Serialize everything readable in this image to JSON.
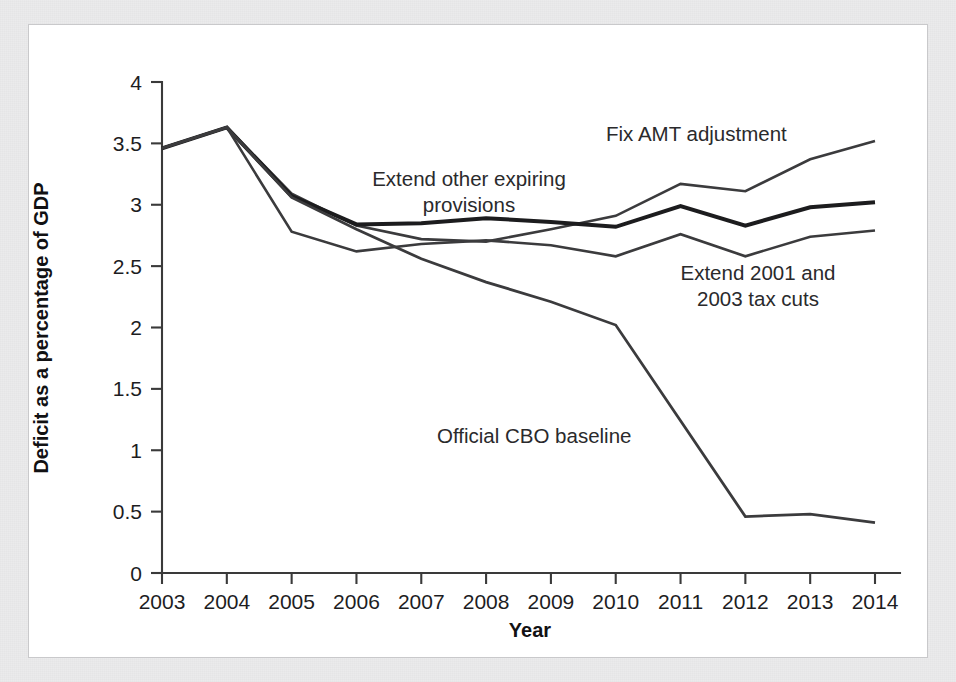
{
  "figure": {
    "frame_color": "#ebebec",
    "plate_color": "#ffffff",
    "plate_border_color": "#c9c9cb",
    "ink_color": "#2b2b2d"
  },
  "axis": {
    "x_title": "Year",
    "y_title": "Deficit as a percentage of GDP",
    "y_ticks": [
      "0",
      "0.5",
      "1",
      "1.5",
      "2",
      "2.5",
      "3",
      "3.5",
      "4"
    ],
    "x_ticks": [
      "2003",
      "2004",
      "2005",
      "2006",
      "2007",
      "2008",
      "2009",
      "2010",
      "2011",
      "2012",
      "2013",
      "2014"
    ]
  },
  "annotations": [
    {
      "id": "fix-amt",
      "line1": "Fix AMT adjustment",
      "line2": ""
    },
    {
      "id": "extend-other",
      "line1": "Extend other expiring",
      "line2": "provisions"
    },
    {
      "id": "extend-tax-cuts",
      "line1": "Extend 2001 and",
      "line2": "2003 tax cuts"
    },
    {
      "id": "cbo-baseline",
      "line1": "Official CBO baseline",
      "line2": ""
    }
  ],
  "chart_data": {
    "type": "line",
    "title": "",
    "xlabel": "Year",
    "ylabel": "Deficit as a percentage of GDP",
    "xlim": [
      2003,
      2014
    ],
    "ylim": [
      0,
      4
    ],
    "ytick_step": 0.5,
    "grid": false,
    "legend": "inline-annotations",
    "x": [
      2003,
      2004,
      2005,
      2006,
      2007,
      2008,
      2009,
      2010,
      2011,
      2012,
      2013,
      2014
    ],
    "series": [
      {
        "name": "Fix AMT adjustment",
        "color": "#3b3b3d",
        "width": 2.6,
        "values": [
          3.46,
          3.63,
          3.09,
          2.83,
          2.72,
          2.7,
          2.8,
          2.91,
          3.17,
          3.11,
          3.37,
          3.52
        ]
      },
      {
        "name": "Extend other expiring provisions",
        "color": "#1c1c1e",
        "width": 4.0,
        "values": [
          3.46,
          3.63,
          3.07,
          2.84,
          2.85,
          2.89,
          2.86,
          2.82,
          2.99,
          2.83,
          2.98,
          3.02
        ]
      },
      {
        "name": "Extend 2001 and 2003 tax cuts",
        "color": "#3b3b3d",
        "width": 2.6,
        "values": [
          3.46,
          3.63,
          2.78,
          2.62,
          2.68,
          2.71,
          2.67,
          2.58,
          2.76,
          2.58,
          2.74,
          2.79
        ]
      },
      {
        "name": "Official CBO baseline",
        "color": "#3b3b3d",
        "width": 2.8,
        "values": [
          3.46,
          3.63,
          3.06,
          2.8,
          2.56,
          2.37,
          2.21,
          2.02,
          1.24,
          0.46,
          0.48,
          0.41
        ]
      }
    ]
  }
}
